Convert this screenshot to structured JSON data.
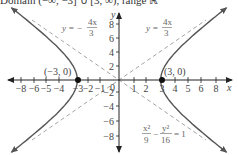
{
  "chart_data": {
    "type": "line",
    "title": "Domain (−∞, −3] ∪ [3, ∞), range ℝ",
    "xlabel": "x",
    "ylabel": "y",
    "xlim": [
      -8.5,
      8.5
    ],
    "ylim": [
      -9,
      9
    ],
    "grid": false,
    "x_ticks": [
      "−8",
      "−6",
      "−5",
      "−4",
      "−3",
      "−2",
      "−1",
      "0",
      "1",
      "2",
      "3",
      "4",
      "5",
      "6",
      "8"
    ],
    "y_ticks": [
      "8",
      "6",
      "4",
      "2",
      "−2",
      "−4",
      "−6",
      "−8"
    ],
    "series": [
      {
        "name": "hyperbola x²/9 − y²/16 = 1",
        "style": "solid",
        "branches": [
          "left",
          "right"
        ]
      },
      {
        "name": "asymptote y = 4x/3",
        "style": "dashed",
        "slope": 1.3333
      },
      {
        "name": "asymptote y = −4x/3",
        "style": "dashed",
        "slope": -1.3333
      }
    ],
    "points": [
      {
        "label": "(−3, 0)",
        "x": -3,
        "y": 0
      },
      {
        "label": "(3, 0)",
        "x": 3,
        "y": 0
      }
    ],
    "annotations": [
      {
        "text": "y = −4x/3",
        "position": "upper-left"
      },
      {
        "text": "y = 4x/3",
        "position": "upper-right"
      },
      {
        "text": "x²/9 − y²/16 = 1",
        "position": "lower-right"
      }
    ]
  },
  "labels": {
    "title": "Domain (−∞, −3] ∪ [3, ∞), range ℝ",
    "x_axis": "x",
    "y_axis": "y",
    "origin": "0",
    "point_left": "(−3, 0)",
    "point_right": "(3, 0)",
    "asym_neg_y": "y = −",
    "asym_neg_num": "4x",
    "asym_neg_den": "3",
    "asym_pos_y": "y = ",
    "asym_pos_num": "4x",
    "asym_pos_den": "3",
    "eq_x_num": "x²",
    "eq_x_den": "9",
    "eq_minus": "−",
    "eq_y_num": "y²",
    "eq_y_den": "16",
    "eq_rhs": "= 1"
  },
  "ticks": {
    "x": [
      {
        "label": "−8",
        "px": 21
      },
      {
        "label": "−6",
        "px": 34
      },
      {
        "label": "−5",
        "px": 46
      },
      {
        "label": "−4",
        "px": 59
      },
      {
        "label": "−3",
        "px": 78
      },
      {
        "label": "−2",
        "px": 88
      },
      {
        "label": "−1",
        "px": 100
      },
      {
        "label": "1",
        "px": 134
      },
      {
        "label": "2",
        "px": 146
      },
      {
        "label": "3",
        "px": 162
      },
      {
        "label": "4",
        "px": 175
      },
      {
        "label": "5",
        "px": 188
      },
      {
        "label": "6",
        "px": 201
      },
      {
        "label": "8",
        "px": 216
      }
    ],
    "y": [
      {
        "label": "8",
        "py": 24
      },
      {
        "label": "6",
        "py": 38
      },
      {
        "label": "4",
        "py": 52
      },
      {
        "label": "2",
        "py": 66
      },
      {
        "label": "−2",
        "py": 92
      },
      {
        "label": "−4",
        "py": 106
      },
      {
        "label": "−6",
        "py": 121
      },
      {
        "label": "−8",
        "py": 136
      }
    ]
  },
  "colors": {
    "axis": "#222222",
    "curve": "#555555",
    "asymptote": "#999999",
    "point": "#111111"
  }
}
